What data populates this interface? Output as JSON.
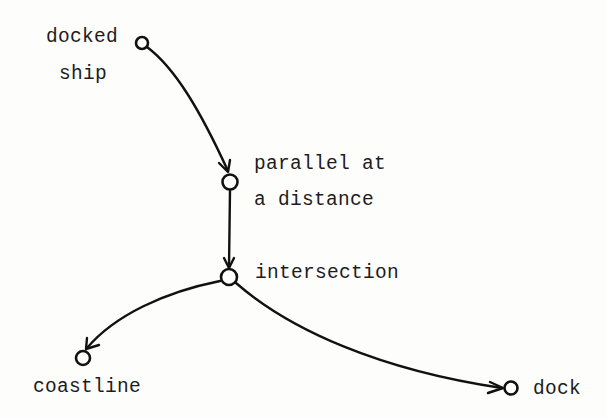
{
  "diagram": {
    "type": "directed-graph",
    "nodes": [
      {
        "id": "docked_ship",
        "label_lines": [
          "docked",
          "ship"
        ],
        "x": 142,
        "y": 43
      },
      {
        "id": "parallel",
        "label_lines": [
          "parallel at",
          "a distance"
        ],
        "x": 230,
        "y": 182
      },
      {
        "id": "intersection",
        "label_lines": [
          "intersection"
        ],
        "x": 229,
        "y": 277
      },
      {
        "id": "coastline",
        "label_lines": [
          "coastline"
        ],
        "x": 83,
        "y": 358
      },
      {
        "id": "dock",
        "label_lines": [
          "dock"
        ],
        "x": 511,
        "y": 388
      }
    ],
    "edges": [
      {
        "from": "docked_ship",
        "to": "parallel"
      },
      {
        "from": "parallel",
        "to": "intersection"
      },
      {
        "from": "intersection",
        "to": "coastline"
      },
      {
        "from": "intersection",
        "to": "dock"
      }
    ],
    "labels": {
      "docked_ship_1": "docked",
      "docked_ship_2": "ship",
      "parallel_1": "parallel at",
      "parallel_2": "a distance",
      "intersection": "intersection",
      "coastline": "coastline",
      "dock": "dock"
    },
    "colors": {
      "ink": "#111111",
      "background": "#fdfdfc"
    }
  }
}
